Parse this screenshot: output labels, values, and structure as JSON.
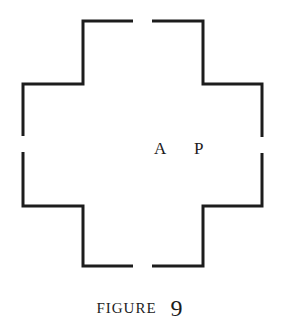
{
  "figure": {
    "caption_word": "FIGURE",
    "caption_number": "9",
    "stroke_color": "#1c1c1c",
    "shape": "cross-shaped (Greek cross) outline with four openings: top, bottom, left, right",
    "labels": [
      {
        "text": "A",
        "x": 160,
        "y": 150
      },
      {
        "text": "P",
        "x": 199,
        "y": 150
      }
    ],
    "segments": [
      {
        "name": "top-left",
        "points": [
          [
            133,
            21
          ],
          [
            83,
            21
          ],
          [
            83,
            84
          ],
          [
            23,
            84
          ],
          [
            23,
            136
          ]
        ]
      },
      {
        "name": "top-right",
        "points": [
          [
            152,
            21
          ],
          [
            203,
            21
          ],
          [
            203,
            84
          ],
          [
            262,
            84
          ],
          [
            262,
            137
          ]
        ]
      },
      {
        "name": "bottom-left",
        "points": [
          [
            23,
            152
          ],
          [
            23,
            206
          ],
          [
            83,
            206
          ],
          [
            83,
            266
          ],
          [
            133,
            266
          ]
        ]
      },
      {
        "name": "bottom-right",
        "points": [
          [
            262,
            153
          ],
          [
            262,
            206
          ],
          [
            203,
            206
          ],
          [
            203,
            266
          ],
          [
            152,
            266
          ]
        ]
      }
    ]
  }
}
